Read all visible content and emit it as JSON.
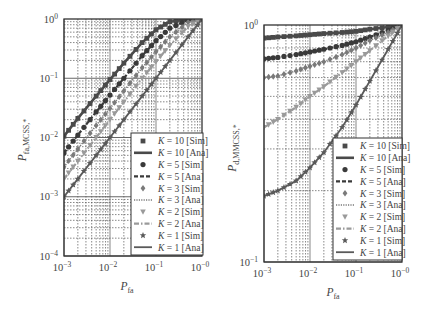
{
  "chart_data": [
    {
      "type": "line",
      "panel": "left",
      "title": "",
      "xlabel": "P_fa",
      "ylabel": "P_fa,MCSS,*",
      "xscale": "log",
      "yscale": "log",
      "xlim": [
        0.001,
        1
      ],
      "ylim": [
        0.0001,
        1
      ],
      "x_ticks": [
        "10^-3",
        "10^-2",
        "10^-1",
        "10^-0"
      ],
      "y_ticks": [
        "10^0",
        "10^-1",
        "10^-2",
        "10^-3",
        "10^-4"
      ],
      "grid": true,
      "legend_position": "lower right",
      "x": [
        0.001,
        0.002,
        0.005,
        0.01,
        0.02,
        0.05,
        0.1,
        0.2,
        0.5,
        1.0
      ],
      "series": [
        {
          "name": "K = 10 [Sim]",
          "marker": "square",
          "values": [
            0.0105,
            0.021,
            0.05,
            0.095,
            0.18,
            0.4,
            0.66,
            0.9,
            0.995,
            1.0
          ]
        },
        {
          "name": "K = 10 [Ana]",
          "line": "solid-thick",
          "values": [
            0.0105,
            0.021,
            0.05,
            0.095,
            0.18,
            0.4,
            0.66,
            0.9,
            0.995,
            1.0
          ]
        },
        {
          "name": "K = 5 [Sim]",
          "marker": "circle",
          "values": [
            0.0055,
            0.011,
            0.027,
            0.052,
            0.1,
            0.24,
            0.43,
            0.7,
            0.97,
            1.0
          ]
        },
        {
          "name": "K = 5 [Ana]",
          "line": "dashed",
          "values": [
            0.0055,
            0.011,
            0.027,
            0.052,
            0.1,
            0.24,
            0.43,
            0.7,
            0.97,
            1.0
          ]
        },
        {
          "name": "K = 3 [Sim]",
          "marker": "diamond",
          "values": [
            0.0032,
            0.0064,
            0.016,
            0.031,
            0.061,
            0.15,
            0.28,
            0.5,
            0.88,
            1.0
          ]
        },
        {
          "name": "K = 3 [Ana]",
          "line": "dotted",
          "values": [
            0.0032,
            0.0064,
            0.016,
            0.031,
            0.061,
            0.15,
            0.28,
            0.5,
            0.88,
            1.0
          ]
        },
        {
          "name": "K = 2 [Sim]",
          "marker": "triangle-down",
          "values": [
            0.002,
            0.004,
            0.01,
            0.02,
            0.04,
            0.1,
            0.19,
            0.36,
            0.75,
            1.0
          ]
        },
        {
          "name": "K = 2 [Ana]",
          "line": "dash-dot",
          "values": [
            0.002,
            0.004,
            0.01,
            0.02,
            0.04,
            0.1,
            0.19,
            0.36,
            0.75,
            1.0
          ]
        },
        {
          "name": "K = 1 [Sim]",
          "marker": "star",
          "values": [
            0.001,
            0.002,
            0.005,
            0.01,
            0.02,
            0.05,
            0.1,
            0.2,
            0.5,
            1.0
          ]
        },
        {
          "name": "K = 1 [Ana]",
          "line": "solid",
          "values": [
            0.001,
            0.002,
            0.005,
            0.01,
            0.02,
            0.05,
            0.1,
            0.2,
            0.5,
            1.0
          ]
        }
      ]
    },
    {
      "type": "line",
      "panel": "right",
      "title": "",
      "xlabel": "P_fa",
      "ylabel": "P_d,MMCSS,*",
      "xscale": "log",
      "yscale": "log",
      "xlim": [
        0.001,
        1
      ],
      "ylim": [
        0.1,
        1
      ],
      "x_ticks": [
        "10^-3",
        "10^-2",
        "10^-1",
        "10^-0"
      ],
      "y_ticks": [
        "10^0",
        "10^-1"
      ],
      "grid": true,
      "legend_position": "lower right",
      "x": [
        0.001,
        0.002,
        0.005,
        0.01,
        0.02,
        0.05,
        0.1,
        0.2,
        0.5,
        1.0
      ],
      "series": [
        {
          "name": "K = 10 [Sim]",
          "marker": "square",
          "values": [
            0.88,
            0.89,
            0.9,
            0.91,
            0.92,
            0.93,
            0.94,
            0.96,
            0.98,
            1.0
          ]
        },
        {
          "name": "K = 10 [Ana]",
          "line": "solid-thick",
          "values": [
            0.88,
            0.89,
            0.9,
            0.91,
            0.92,
            0.93,
            0.94,
            0.96,
            0.98,
            1.0
          ]
        },
        {
          "name": "K = 5 [Sim]",
          "marker": "circle",
          "values": [
            0.72,
            0.73,
            0.75,
            0.77,
            0.79,
            0.82,
            0.85,
            0.89,
            0.95,
            1.0
          ]
        },
        {
          "name": "K = 5 [Ana]",
          "line": "dashed",
          "values": [
            0.72,
            0.73,
            0.75,
            0.77,
            0.79,
            0.82,
            0.85,
            0.89,
            0.95,
            1.0
          ]
        },
        {
          "name": "K = 3 [Sim]",
          "marker": "diamond",
          "values": [
            0.6,
            0.61,
            0.64,
            0.67,
            0.7,
            0.75,
            0.8,
            0.86,
            0.93,
            1.0
          ]
        },
        {
          "name": "K = 3 [Ana]",
          "line": "dotted",
          "values": [
            0.6,
            0.61,
            0.64,
            0.67,
            0.7,
            0.75,
            0.8,
            0.86,
            0.93,
            1.0
          ]
        },
        {
          "name": "K = 2 [Sim]",
          "marker": "triangle-down",
          "values": [
            0.37,
            0.4,
            0.45,
            0.5,
            0.55,
            0.63,
            0.7,
            0.78,
            0.9,
            1.0
          ]
        },
        {
          "name": "K = 2 [Ana]",
          "line": "dash-dot",
          "values": [
            0.37,
            0.4,
            0.45,
            0.5,
            0.55,
            0.63,
            0.7,
            0.78,
            0.9,
            1.0
          ]
        },
        {
          "name": "K = 1 [Sim]",
          "marker": "star",
          "values": [
            0.19,
            0.2,
            0.22,
            0.25,
            0.29,
            0.37,
            0.46,
            0.58,
            0.79,
            1.0
          ]
        },
        {
          "name": "K = 1 [Ana]",
          "line": "solid",
          "values": [
            0.19,
            0.2,
            0.22,
            0.25,
            0.29,
            0.37,
            0.46,
            0.58,
            0.79,
            1.0
          ]
        }
      ]
    }
  ],
  "labels": {
    "left": {
      "ylabel_main": "P",
      "ylabel_sub": "fa,MCSS,*",
      "xlabel_main": "P",
      "xlabel_sub": "fa",
      "yticks": [
        {
          "base": "10",
          "exp": "0"
        },
        {
          "base": "10",
          "exp": "−1"
        },
        {
          "base": "10",
          "exp": "−2"
        },
        {
          "base": "10",
          "exp": "−3"
        },
        {
          "base": "10",
          "exp": "−4"
        }
      ]
    },
    "right": {
      "ylabel_main": "P",
      "ylabel_sub": "d,MMCSS,*",
      "xlabel_main": "P",
      "xlabel_sub": "fa",
      "yticks": [
        {
          "base": "10",
          "exp": "0"
        },
        {
          "base": "10",
          "exp": "−1"
        }
      ]
    },
    "xticks": [
      {
        "base": "10",
        "exp": "−3"
      },
      {
        "base": "10",
        "exp": "−2"
      },
      {
        "base": "10",
        "exp": "−1"
      },
      {
        "base": "10",
        "exp": "−0"
      }
    ],
    "legend": [
      {
        "k": "K",
        "eq": " = 10 [Sim]"
      },
      {
        "k": "K",
        "eq": " = 10 [Ana]"
      },
      {
        "k": "K",
        "eq": " = 5 [Sim]"
      },
      {
        "k": "K",
        "eq": " = 5 [Ana]"
      },
      {
        "k": "K",
        "eq": " = 3 [Sim]"
      },
      {
        "k": "K",
        "eq": " = 3 [Ana]"
      },
      {
        "k": "K",
        "eq": " = 2 [Sim]"
      },
      {
        "k": "K",
        "eq": " = 2 [Ana]"
      },
      {
        "k": "K",
        "eq": " = 1 [Sim]"
      },
      {
        "k": "K",
        "eq": " = 1 [Ana]"
      }
    ]
  },
  "colors": {
    "k10": "#4a4a4a",
    "k5": "#3a3a3a",
    "k3": "#7a7a7a",
    "k2": "#9a9a9a",
    "k1": "#5a5a5a",
    "grid": "#555555",
    "frame": "#333333"
  }
}
